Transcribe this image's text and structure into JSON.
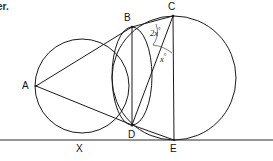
{
  "figure": {
    "corner_text": "er.",
    "background_color": "#ffffff",
    "stroke_color": "#1a1a1a",
    "arc_color": "#5a5a5a"
  },
  "points": [
    {
      "id": "A",
      "label": "A",
      "x": 36,
      "y": 86,
      "label_x": 22,
      "label_y": 81
    },
    {
      "id": "B",
      "label": "B",
      "x": 132,
      "y": 27,
      "label_x": 124,
      "label_y": 13
    },
    {
      "id": "C",
      "label": "C",
      "x": 173,
      "y": 16,
      "label_x": 168,
      "label_y": 2
    },
    {
      "id": "D",
      "label": "D",
      "x": 132,
      "y": 125,
      "label_x": 128,
      "label_y": 130
    },
    {
      "id": "X",
      "label": "X",
      "x": 80,
      "y": 140,
      "label_x": 76,
      "label_y": 144
    },
    {
      "id": "E",
      "label": "E",
      "x": 174,
      "y": 140,
      "label_x": 170,
      "label_y": 144
    }
  ],
  "circles": [
    {
      "id": "left-circle",
      "cx": 82,
      "cy": 86,
      "r": 47
    },
    {
      "id": "middle-circle",
      "cx": 132,
      "cy": 76,
      "rx": 20,
      "ry": 49
    },
    {
      "id": "right-circle",
      "cx": 174,
      "cy": 78,
      "r": 62
    }
  ],
  "segments": [
    {
      "id": "AB",
      "from": "A",
      "to": "B"
    },
    {
      "id": "AD",
      "from": "A",
      "to": "D"
    },
    {
      "id": "BC",
      "from": "B",
      "to": "C"
    },
    {
      "id": "BD",
      "from": "B",
      "to": "D"
    },
    {
      "id": "CD",
      "from": "C",
      "to": "D"
    },
    {
      "id": "CE",
      "from": "C",
      "to": "E"
    },
    {
      "id": "DE",
      "from": "D",
      "to": "E"
    }
  ],
  "baseline": {
    "id": "tangent-line",
    "x1": 0,
    "y1": 140,
    "x2": 273,
    "y2": 140
  },
  "angles": [
    {
      "id": "angle-bcd",
      "vertex": "C",
      "value": "2x",
      "degree_symbol": "°",
      "label_x": 150,
      "label_y": 27,
      "arc": "M 156 24 A 22 22 0 0 1 153 45"
    },
    {
      "id": "angle-dce",
      "vertex": "C",
      "value": "x",
      "degree_symbol": "°",
      "label_x": 160,
      "label_y": 53,
      "arc": "M 153 45 A 37 37 0 0 1 172 53"
    }
  ]
}
